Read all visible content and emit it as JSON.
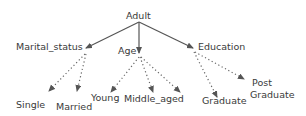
{
  "diagram": {
    "type": "concept-hierarchy-tree",
    "colors": {
      "edge": "#555555",
      "text": "#3a3a3a",
      "background": "#ffffff"
    },
    "root": {
      "id": "adult",
      "label": "Adult"
    },
    "attributes": [
      {
        "id": "marital_status",
        "label": "Marital_status"
      },
      {
        "id": "age",
        "label": "Age"
      },
      {
        "id": "education",
        "label": "Education"
      }
    ],
    "values": [
      {
        "id": "single",
        "label": "Single",
        "parent": "marital_status"
      },
      {
        "id": "married",
        "label": "Married",
        "parent": "marital_status"
      },
      {
        "id": "young",
        "label": "Young",
        "parent": "age"
      },
      {
        "id": "middle_aged",
        "label": "Middle_aged",
        "parent": "age"
      },
      {
        "id": "graduate",
        "label": "Graduate",
        "parent": "education"
      },
      {
        "id": "post_graduate_line1",
        "label": "Post",
        "parent": "education"
      },
      {
        "id": "post_graduate_line2",
        "label": "Graduate",
        "parent": "education"
      }
    ],
    "edges": {
      "solid": [
        "adult->marital_status",
        "adult->age",
        "adult->education"
      ],
      "dotted": [
        "marital_status->single",
        "marital_status->married",
        "age->young",
        "age->middle_aged",
        "age->old(unlabeled)",
        "education->graduate",
        "education->post_graduate"
      ]
    }
  }
}
